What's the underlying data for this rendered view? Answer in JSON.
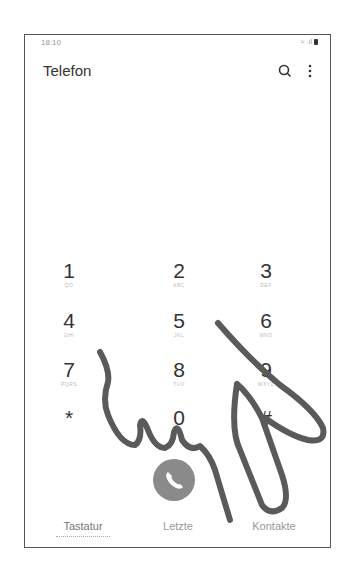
{
  "status_bar": {
    "time": "18:10",
    "signal": "wifi-signal-icons"
  },
  "header": {
    "title": "Telefon",
    "search_icon": "search-icon",
    "more_icon": "more-vert-icon"
  },
  "dialpad": {
    "keys": [
      {
        "digit": "1",
        "letters": "QO"
      },
      {
        "digit": "2",
        "letters": "ABC"
      },
      {
        "digit": "3",
        "letters": "DEF"
      },
      {
        "digit": "4",
        "letters": "GHI"
      },
      {
        "digit": "5",
        "letters": "JKL"
      },
      {
        "digit": "6",
        "letters": "MNO"
      },
      {
        "digit": "7",
        "letters": "PQRS"
      },
      {
        "digit": "8",
        "letters": "TUV"
      },
      {
        "digit": "9",
        "letters": "WXYZ"
      },
      {
        "digit": "*",
        "letters": ""
      },
      {
        "digit": "0",
        "letters": "+"
      },
      {
        "digit": "#",
        "letters": ""
      }
    ],
    "call_icon": "phone-call-icon"
  },
  "tabs": [
    {
      "label": "Tastatur",
      "active": true
    },
    {
      "label": "Letzte",
      "active": false
    },
    {
      "label": "Kontakte",
      "active": false
    }
  ],
  "overlay": {
    "icon": "pointing-hand-illustration",
    "stroke_color": "#5a5a5a"
  },
  "colors": {
    "call_button": "#8a8a8a",
    "text": "#333333",
    "frame": "#555555"
  }
}
